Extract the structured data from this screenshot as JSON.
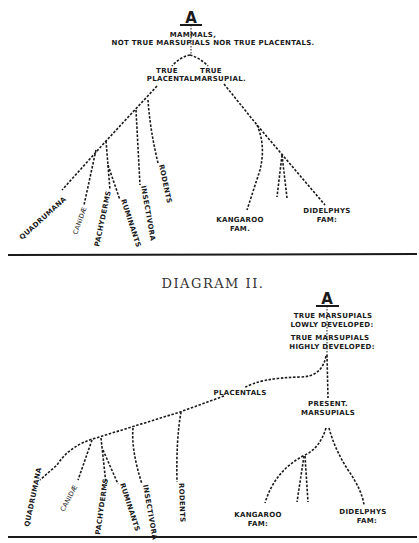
{
  "diagram1": {
    "root_letter": "A",
    "root_label_1": "MAMMALS,",
    "root_label_2": "NOT TRUE MARSUPIALS NOR TRUE PLACENTALS.",
    "placental_1": "TRUE",
    "placental_2": "PLACENTAL.",
    "marsupial_1": "TRUE",
    "marsupial_2": "MARSUPIAL.",
    "leaves": {
      "quadrumana": "QUADRUMANA",
      "canidae": "CANIDÆ",
      "pachyderms": "PACHYDERMS",
      "ruminants": "RUMINANTS",
      "insectivora": "INSECTIVORA",
      "rodents": "RODENTS",
      "kangaroo_1": "KANGAROO",
      "kangaroo_2": "FAM.",
      "didelphys_1": "DIDELPHYS",
      "didelphys_2": "FAM:"
    }
  },
  "diagram2": {
    "title": "DIAGRAM II.",
    "root_letter": "A",
    "lowly_1": "TRUE MARSUPIALS",
    "lowly_2": "LOWLY DEVELOPED:",
    "highly_1": "TRUE MARSUPIALS",
    "highly_2": "HIGHLY DEVELOPED:",
    "placentals": "PLACENTALS",
    "present_1": "PRESENT.",
    "present_2": "MARSUPIALS",
    "leaves": {
      "quadrumana": "QUADRUMANA",
      "canidae": "CANIDÆ",
      "pachyderms": "PACHYDERMS",
      "ruminants": "RUMINANTS",
      "insectivora": "INSECTIVORA",
      "rodents": "RODENTS",
      "kangaroo_1": "KANGAROO",
      "kangaroo_2": "FAM:",
      "didelphys_1": "DIDELPHYS",
      "didelphys_2": "FAM:"
    }
  }
}
